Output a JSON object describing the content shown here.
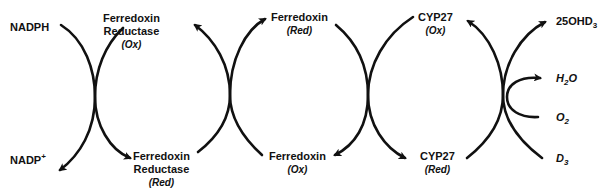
{
  "diagram": {
    "left_cycle": {
      "top_left": "NADPH",
      "bottom_left": "NADP",
      "bottom_left_charge": "+"
    },
    "fdr_ox": {
      "name_line1": "Ferredoxin",
      "name_line2": "Reductase",
      "state": "(Ox)"
    },
    "fdr_red": {
      "name_line1": "Ferredoxin",
      "name_line2": "Reductase",
      "state": "(Red)"
    },
    "fdx_red": {
      "name": "Ferredoxin",
      "state": "(Red)"
    },
    "fdx_ox": {
      "name": "Ferredoxin",
      "state": "(Ox)"
    },
    "cyp_ox": {
      "name": "CYP27",
      "state": "(Ox)"
    },
    "cyp_red": {
      "name": "CYP27",
      "state": "(Red)"
    },
    "products": {
      "p1_main": "25OHD",
      "p1_sub": "3",
      "water_h": "H",
      "water_sub": "2",
      "water_o": "O",
      "oxygen_main": "O",
      "oxygen_sub": "2",
      "substrate_main": "D",
      "substrate_sub": "3"
    },
    "stroke_color": "#111111"
  }
}
